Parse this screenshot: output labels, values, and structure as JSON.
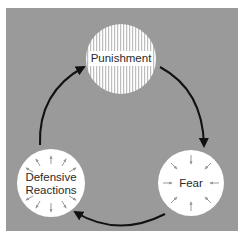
{
  "diagram": {
    "type": "cycle",
    "background_color": "#9a9a9a",
    "nodes": [
      {
        "id": "punishment",
        "label": "Punishment",
        "fill": "vertical-stripes",
        "position": "top"
      },
      {
        "id": "fear",
        "label": "Fear",
        "fill": "#ffffff",
        "arrows": "inward",
        "position": "bottom-right"
      },
      {
        "id": "defensive",
        "label_line1": "Defensive",
        "label_line2": "Reactions",
        "fill": "#ffffff",
        "arrows": "outward",
        "position": "bottom-left"
      }
    ],
    "edges": [
      {
        "from": "punishment",
        "to": "fear"
      },
      {
        "from": "fear",
        "to": "defensive"
      },
      {
        "from": "defensive",
        "to": "punishment"
      }
    ]
  }
}
